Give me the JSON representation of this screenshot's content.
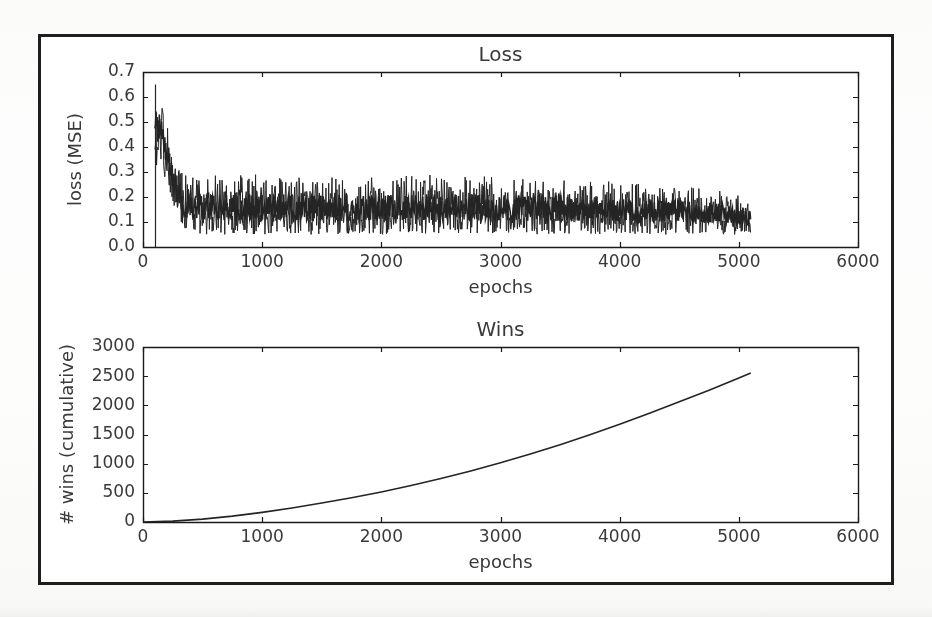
{
  "figure": {
    "background_color": "#ffffff",
    "page_background_color": "#fdfdfc",
    "border_color": "#1e1e1e",
    "line_color": "#242424",
    "text_color": "#3a3a3a",
    "axis_color": "#1a1a1a"
  },
  "chart_data": [
    {
      "type": "line",
      "title": "Loss",
      "xlabel": "epochs",
      "ylabel": "loss (MSE)",
      "xlim": [
        0,
        6000
      ],
      "ylim": [
        0.0,
        0.7
      ],
      "xticks": [
        0,
        1000,
        2000,
        3000,
        4000,
        5000,
        6000
      ],
      "xtick_labels": [
        "0",
        "1000",
        "2000",
        "3000",
        "4000",
        "5000",
        "6000"
      ],
      "yticks": [
        0.0,
        0.1,
        0.2,
        0.3,
        0.4,
        0.5,
        0.6,
        0.7
      ],
      "ytick_labels": [
        "0.0",
        "0.1",
        "0.2",
        "0.3",
        "0.4",
        "0.5",
        "0.6",
        "0.7"
      ],
      "grid": false,
      "legend": null,
      "series": [
        {
          "name": "loss (MSE)",
          "description": "noisy per-epoch MSE loss, spikes to 0.65 near epoch 110 then decays and plateaus as a dense noise band; data ends at epoch 5100",
          "x_start": 100,
          "x_end": 5100,
          "envelope_x": [
            100,
            150,
            200,
            250,
            300,
            350,
            400,
            500,
            700,
            900,
            1200,
            1500,
            2000,
            2500,
            3000,
            3500,
            4000,
            4500,
            4800,
            5100
          ],
          "envelope_upper": [
            0.65,
            0.62,
            0.52,
            0.4,
            0.33,
            0.3,
            0.3,
            0.29,
            0.3,
            0.29,
            0.29,
            0.28,
            0.28,
            0.29,
            0.28,
            0.27,
            0.26,
            0.25,
            0.23,
            0.2
          ],
          "envelope_lower": [
            0.33,
            0.32,
            0.26,
            0.17,
            0.1,
            0.07,
            0.06,
            0.05,
            0.05,
            0.05,
            0.05,
            0.05,
            0.05,
            0.05,
            0.05,
            0.05,
            0.05,
            0.05,
            0.05,
            0.05
          ],
          "envelope_mid": [
            0.5,
            0.47,
            0.38,
            0.27,
            0.19,
            0.16,
            0.15,
            0.15,
            0.15,
            0.15,
            0.15,
            0.15,
            0.15,
            0.15,
            0.15,
            0.15,
            0.14,
            0.14,
            0.13,
            0.12
          ]
        }
      ]
    },
    {
      "type": "line",
      "title": "Wins",
      "xlabel": "epochs",
      "ylabel": "# wins (cumulative)",
      "xlim": [
        0,
        6000
      ],
      "ylim": [
        0,
        3000
      ],
      "xticks": [
        0,
        1000,
        2000,
        3000,
        4000,
        5000,
        6000
      ],
      "xtick_labels": [
        "0",
        "1000",
        "2000",
        "3000",
        "4000",
        "5000",
        "6000"
      ],
      "yticks": [
        0,
        500,
        1000,
        1500,
        2000,
        2500,
        3000
      ],
      "ytick_labels": [
        "0",
        "500",
        "1000",
        "1500",
        "2000",
        "2500",
        "3000"
      ],
      "grid": false,
      "legend": null,
      "series": [
        {
          "name": "# wins (cumulative)",
          "description": "smooth monotonically increasing, slightly convex cumulative win count ending at epoch 5100",
          "x": [
            0,
            250,
            500,
            750,
            1000,
            1250,
            1500,
            1750,
            2000,
            2250,
            2500,
            2750,
            3000,
            3250,
            3500,
            3750,
            4000,
            4250,
            4500,
            4750,
            5000,
            5100
          ],
          "values": [
            0,
            15,
            50,
            100,
            165,
            240,
            325,
            415,
            515,
            625,
            745,
            875,
            1015,
            1165,
            1325,
            1495,
            1675,
            1865,
            2060,
            2260,
            2470,
            2555
          ]
        }
      ]
    }
  ]
}
